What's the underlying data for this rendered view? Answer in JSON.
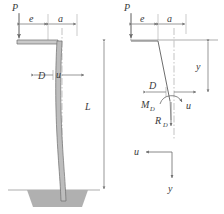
{
  "figure": {
    "type": "engineering-diagram",
    "colors": {
      "line": "#555555",
      "thin_line": "#8a8a8a",
      "pole_fill": "#b3b3b3",
      "foundation_fill": "#b0b0b0",
      "text": "#3a3a3a",
      "background": "#ffffff"
    }
  },
  "left_view": {
    "name": "deflected-shape-view",
    "labels": {
      "load": "P",
      "dim_e": "e",
      "dim_a": "a",
      "diameter": "D",
      "deflection": "u",
      "length": "L"
    }
  },
  "right_view": {
    "name": "free-body-view",
    "labels": {
      "load": "P",
      "dim_e": "e",
      "dim_a": "a",
      "diameter": "D",
      "moment": "M",
      "moment_sub": "D",
      "reaction": "R",
      "reaction_sub": "D",
      "deflection": "u",
      "depth": "y"
    },
    "axes": {
      "horizontal": "u",
      "vertical": "y"
    }
  }
}
